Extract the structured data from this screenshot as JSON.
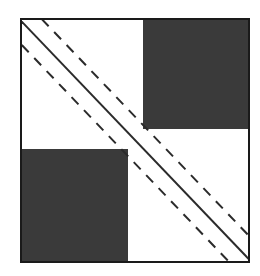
{
  "figure": {
    "type": "diagram",
    "canvas": {
      "width": 260,
      "height": 276,
      "background": "#ffffff"
    },
    "frame": {
      "name": "matrix-outline",
      "x": 20,
      "y": 18,
      "width": 230,
      "height": 245,
      "border_color": "#1a1a1a",
      "border_width": 2,
      "fill": "#ffffff"
    },
    "blocks": [
      {
        "name": "top-right-block",
        "position": "top-right",
        "x": 121,
        "y": 0,
        "width": 105,
        "height": 109,
        "fill": "#3a3a3a"
      },
      {
        "name": "bottom-left-block",
        "position": "bottom-left",
        "x": 0,
        "y": 129,
        "width": 106,
        "height": 112,
        "fill": "#3a3a3a"
      }
    ],
    "diagonals": {
      "direction": "top-left-to-bottom-right",
      "count": 3,
      "color": "#2b2b2b",
      "lines": [
        {
          "name": "upper-dashed-diagonal",
          "style": "dashed",
          "offset": -14,
          "width": 2,
          "dash": "10 8"
        },
        {
          "name": "center-solid-diagonal",
          "style": "solid",
          "offset": 0,
          "width": 2,
          "dash": "none"
        },
        {
          "name": "lower-dashed-diagonal",
          "style": "dashed",
          "offset": 14,
          "width": 2,
          "dash": "10 8"
        }
      ]
    }
  }
}
